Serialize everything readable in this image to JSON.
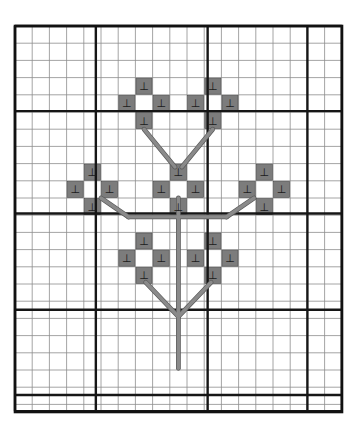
{
  "document": {
    "title": "Cross-stitch pattern chart",
    "kind": "needlework-grid-chart"
  },
  "canvas": {
    "width": 361,
    "height": 430,
    "background": "#ffffff"
  },
  "grid": {
    "origin_x": 15,
    "origin_y": 26,
    "cell": 17.2,
    "cols": 19,
    "rows": 22.4,
    "width": 327,
    "height": 386,
    "minor_color": "#8d8d8d",
    "minor_width": 0.8,
    "major_color": "#161616",
    "major_width": 2.4,
    "border_color": "#111111",
    "border_width": 2.6,
    "major_cols": [
      0,
      4.7,
      11.2,
      17.0,
      19
    ],
    "major_rows": [
      0,
      4.95,
      10.9,
      16.5,
      21.45,
      22.4
    ]
  },
  "symbols": {
    "filled": {
      "name": "perpendicular-tack",
      "glyph": "⊥",
      "fill_color": "#7c7c7c",
      "stroke_color": "#4a4a4a",
      "glyph_color": "#1a1a1a"
    },
    "empty": {
      "name": "blank-cell",
      "glyph": "",
      "fill_color": "#ffffff"
    }
  },
  "stitch_cells": [
    {
      "col": 7,
      "row": 3
    },
    {
      "col": 11,
      "row": 3
    },
    {
      "col": 6,
      "row": 4
    },
    {
      "col": 8,
      "row": 4
    },
    {
      "col": 10,
      "row": 4
    },
    {
      "col": 12,
      "row": 4
    },
    {
      "col": 7,
      "row": 5
    },
    {
      "col": 11,
      "row": 5
    },
    {
      "col": 4,
      "row": 8
    },
    {
      "col": 9,
      "row": 8
    },
    {
      "col": 14,
      "row": 8
    },
    {
      "col": 3,
      "row": 9
    },
    {
      "col": 5,
      "row": 9
    },
    {
      "col": 8,
      "row": 9
    },
    {
      "col": 10,
      "row": 9
    },
    {
      "col": 13,
      "row": 9
    },
    {
      "col": 15,
      "row": 9
    },
    {
      "col": 4,
      "row": 10
    },
    {
      "col": 9,
      "row": 10
    },
    {
      "col": 14,
      "row": 10
    },
    {
      "col": 7,
      "row": 12
    },
    {
      "col": 11,
      "row": 12
    },
    {
      "col": 6,
      "row": 13
    },
    {
      "col": 8,
      "row": 13
    },
    {
      "col": 10,
      "row": 13
    },
    {
      "col": 12,
      "row": 13
    },
    {
      "col": 7,
      "row": 14
    },
    {
      "col": 11,
      "row": 14
    }
  ],
  "stem_lines": [
    {
      "name": "main-stem",
      "x1": 9.5,
      "y1": 10.0,
      "x2": 9.5,
      "y2": 19.9
    },
    {
      "name": "branch-lower-left",
      "x1": 7.6,
      "y1": 14.9,
      "x2": 9.5,
      "y2": 16.9
    },
    {
      "name": "branch-lower-right",
      "x1": 11.4,
      "y1": 14.9,
      "x2": 9.5,
      "y2": 16.9
    },
    {
      "name": "branch-upper-left",
      "x1": 7.5,
      "y1": 6.0,
      "x2": 9.3,
      "y2": 8.2
    },
    {
      "name": "branch-upper-right",
      "x1": 11.5,
      "y1": 6.0,
      "x2": 9.7,
      "y2": 8.2
    },
    {
      "name": "branch-side-left-diag",
      "x1": 5.0,
      "y1": 10.0,
      "x2": 6.6,
      "y2": 11.1
    },
    {
      "name": "branch-side-left-horiz",
      "x1": 6.6,
      "y1": 11.1,
      "x2": 9.5,
      "y2": 11.1
    },
    {
      "name": "branch-side-right-diag",
      "x1": 13.9,
      "y1": 10.0,
      "x2": 12.3,
      "y2": 11.1
    },
    {
      "name": "branch-side-right-horiz",
      "x1": 12.3,
      "y1": 11.1,
      "x2": 9.5,
      "y2": 11.1
    }
  ],
  "stem_style": {
    "color": "#8a8a8a",
    "outline": "#5a5a5a",
    "width": 3.4
  },
  "motifs": [
    {
      "name": "flower-top-left",
      "center_col": 7,
      "center_row": 4
    },
    {
      "name": "flower-top-right",
      "center_col": 11,
      "center_row": 4
    },
    {
      "name": "flower-mid-left",
      "center_col": 4,
      "center_row": 9
    },
    {
      "name": "flower-mid-center",
      "center_col": 9,
      "center_row": 9
    },
    {
      "name": "flower-mid-right",
      "center_col": 14,
      "center_row": 9
    },
    {
      "name": "flower-bottom-left",
      "center_col": 7,
      "center_row": 13
    },
    {
      "name": "flower-bottom-right",
      "center_col": 11,
      "center_row": 13
    }
  ]
}
